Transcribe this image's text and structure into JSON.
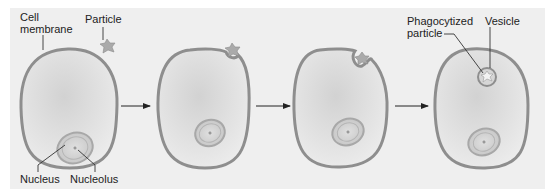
{
  "figure": {
    "type": "phagocytosis-sequence",
    "stages": [
      {
        "id": "stage-1",
        "description": "Particle approaches cell membrane"
      },
      {
        "id": "stage-2",
        "description": "Membrane begins to indent around particle"
      },
      {
        "id": "stage-3",
        "description": "Membrane engulfs particle"
      },
      {
        "id": "stage-4",
        "description": "Particle enclosed in vesicle inside cell"
      }
    ],
    "arrows": 3
  },
  "labels": {
    "cell_membrane_line1": "Cell",
    "cell_membrane_line2": "membrane",
    "particle": "Particle",
    "nucleus": "Nucleus",
    "nucleolus": "Nucleolus",
    "phagocytized_line1": "Phagocytized",
    "phagocytized_line2": "particle",
    "vesicle": "Vesicle"
  },
  "colors": {
    "panel_background": "#efefef",
    "membrane": "#8e8e8e",
    "cytoplasm": "#dcdcdc",
    "nucleus_fill": "#c9c9c9",
    "particle": "#a8a8a8",
    "leader_lines": "#333333"
  }
}
